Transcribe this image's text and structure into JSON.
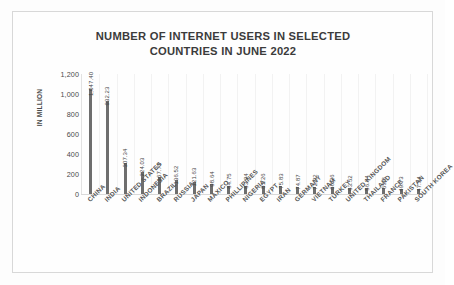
{
  "chart_data": {
    "type": "bar",
    "title": "NUMBER OF INTERNET USERS IN SELECTED COUNTRIES IN JUNE 2022",
    "title_line1": "NUMBER OF INTERNET USERS IN SELECTED",
    "title_line2": "COUNTRIES IN JUNE 2022",
    "xlabel": "",
    "ylabel": "IN MILLION",
    "ylim": [
      0,
      1200
    ],
    "yticks": [
      "0",
      "200",
      "400",
      "600",
      "800",
      "1,000",
      "1,200"
    ],
    "ytick_values": [
      0,
      200,
      400,
      600,
      800,
      1000,
      1200
    ],
    "grid": true,
    "legend": "none",
    "bar_color": "#6e6e6e",
    "categories": [
      "CHINA",
      "INDIA",
      "UNITED STATES",
      "INDONESIA",
      "BRAZIL",
      "RUSSIA",
      "JAPAN",
      "MAXICO",
      "PHILLIPINES",
      "NIGERIA",
      "EGYPT",
      "IRAN",
      "GERMANY",
      "VIETNAM",
      "TURKEY",
      "UNITED KINGDOM",
      "THAILAND",
      "FRANCE",
      "PAKISTAN",
      "SOUTH KOREA"
    ],
    "values": [
      1047.4,
      932.23,
      307.34,
      224.03,
      167.73,
      136.52,
      121.63,
      98.64,
      84.75,
      83.94,
      81.26,
      75.83,
      74.87,
      72.92,
      68.26,
      63.52,
      56.84,
      55.8,
      49.73,
      47.34
    ],
    "value_labels": [
      "1,047.40",
      "932.23",
      "307.34",
      "224.03",
      "167.73",
      "136.52",
      "121.63",
      "98.64",
      "84.75",
      "83.94",
      "81.26",
      "75.83",
      "74.87",
      "72.92",
      "68.26",
      "63.52",
      "56.84",
      "55.8",
      "49.73",
      "47.34"
    ]
  }
}
